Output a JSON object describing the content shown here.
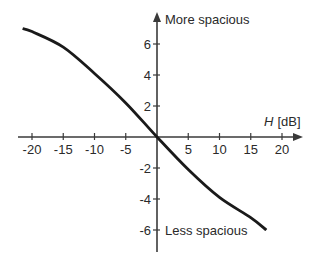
{
  "chart_data": {
    "type": "line",
    "title": "",
    "xlabel": "H [dB]",
    "xlabel_var": "H",
    "xlabel_unit": "[dB]",
    "ylabel": "",
    "xlim": [
      -22,
      22
    ],
    "ylim": [
      -7.5,
      8
    ],
    "x_ticks": [
      -20,
      -15,
      -10,
      -5,
      5,
      10,
      15,
      20
    ],
    "y_ticks": [
      6,
      4,
      2,
      -2,
      -4,
      -6
    ],
    "grid": false,
    "annotations": {
      "top": "More spacious",
      "bottom": "Less spacious"
    },
    "series": [
      {
        "name": "spaciousness",
        "x": [
          -21.5,
          -20,
          -15,
          -10,
          -5,
          0,
          5,
          10,
          15,
          17.5
        ],
        "y": [
          7.0,
          6.8,
          5.8,
          4.1,
          2.2,
          0,
          -2.1,
          -3.9,
          -5.2,
          -6.0
        ],
        "color": "#1a1a1a"
      }
    ]
  },
  "colors": {
    "axis": "#3a3a3a",
    "curve": "#1a1a1a",
    "text": "#2a2a2a"
  }
}
